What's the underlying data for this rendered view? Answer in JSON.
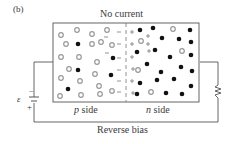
{
  "panel_label": "(b)",
  "title": "No current",
  "regions": {
    "p_side": {
      "italic": "p",
      "text": " side"
    },
    "n_side": {
      "italic": "n",
      "text": " side"
    }
  },
  "caption": "Reverse bias",
  "battery": {
    "symbol": "ε",
    "neg": "−",
    "pos": "+"
  },
  "colors": {
    "wire": "#555555",
    "hole": "#9a9a9a",
    "electron": "#111111",
    "charge": "#888888"
  },
  "depletion": {
    "negative_ions_p_side": 8,
    "positive_ions_n_side": 8
  }
}
